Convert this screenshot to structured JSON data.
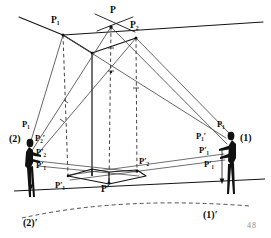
{
  "figure": {
    "page_number": "48",
    "ink_color": "#141414",
    "dashed_color": "#3a3a3a",
    "thin_color": "#4a4a4a",
    "background": "#ffffff"
  },
  "labels": {
    "apex_p": "P",
    "apex_p1": "P₁",
    "apex_p2": "P₂",
    "ground_p_prime": "P′",
    "ground_p1_prime": "P′₁",
    "ground_p2_prime": "P′₂",
    "left_p1": "P₁",
    "left_p2_alt": "P₂′",
    "left_p2_prime": "P′₂",
    "left_p1_prime": "P′₁",
    "right_p1": "P₁",
    "right_p1_alt": "P₁′",
    "right_p1_prime_upper": "P′₁",
    "right_p1_prime_lower": "P′₁",
    "observer_left": "(2)",
    "observer_left_ground": "(2)′",
    "observer_right": "(1)",
    "observer_right_ground": "(1)′"
  },
  "label_parts": {
    "P": {
      "base": "P",
      "sub": "",
      "prime": ""
    },
    "P1": {
      "base": "P",
      "sub": "1",
      "prime": ""
    },
    "P2": {
      "base": "P",
      "sub": "2",
      "prime": ""
    },
    "Pp": {
      "base": "P",
      "sub": "",
      "prime": "′"
    },
    "P1p": {
      "base": "P",
      "sub": "1",
      "prime": "′"
    },
    "P2p": {
      "base": "P",
      "sub": "2",
      "prime": "′"
    }
  },
  "geometry": {
    "apex_points": [
      {
        "name": "P",
        "x": 111,
        "y": 27
      },
      {
        "name": "P1",
        "x": 63,
        "y": 35
      },
      {
        "name": "P2",
        "x": 136,
        "y": 38
      }
    ],
    "ground_points": [
      {
        "name": "P-prime",
        "x": 109,
        "y": 182
      },
      {
        "name": "P1-prime",
        "x": 68,
        "y": 175
      },
      {
        "name": "P2-prime",
        "x": 137,
        "y": 172
      }
    ],
    "observers": [
      {
        "name": "left",
        "x": 27,
        "ground_y": 196
      },
      {
        "name": "right",
        "x": 231,
        "ground_y": 192
      }
    ],
    "horizon_line": {
      "x1": 18,
      "y1": 18,
      "x2": 262,
      "y2": 30
    },
    "ground_line": {
      "x1": 14,
      "y1": 190,
      "x2": 264,
      "y2": 178
    }
  }
}
